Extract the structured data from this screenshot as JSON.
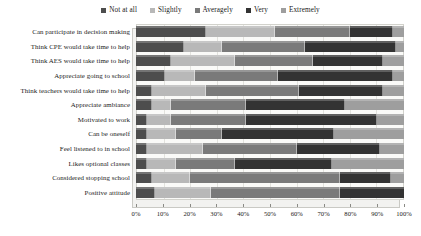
{
  "chart_data": {
    "type": "bar",
    "orientation": "horizontal",
    "stacked": true,
    "title": "",
    "xlabel": "",
    "ylabel": "",
    "xlim": [
      0,
      100
    ],
    "xunit": "%",
    "grid": true,
    "legend_position": "top-center",
    "xticks": [
      "0%",
      "10%",
      "20%",
      "30%",
      "40%",
      "50%",
      "60%",
      "70%",
      "80%",
      "90%",
      "100%"
    ],
    "categories": [
      "Can participate in decision making",
      "Think CPE would take time to help",
      "Think AES would take time to help",
      "Appreciate going to school",
      "Think teachers would take time to help",
      "Appreciate ambiance",
      "Motivated to work",
      "Can be oneself",
      "Feel listened to in school",
      "Likes optional classes",
      "Considered stopping school",
      "Positive attitude"
    ],
    "series": [
      {
        "name": "Not at all",
        "color": "#4d4d4d",
        "values": [
          26,
          18,
          13,
          11,
          6,
          6,
          4,
          4,
          4,
          4,
          6,
          7
        ]
      },
      {
        "name": "Slightly",
        "color": "#b8b8b8",
        "values": [
          26,
          14,
          24,
          11,
          20,
          7,
          9,
          11,
          21,
          11,
          14,
          21
        ]
      },
      {
        "name": "Averagely",
        "color": "#7a7a7a",
        "values": [
          28,
          31,
          29,
          31,
          35,
          28,
          28,
          17,
          35,
          22,
          56,
          48
        ]
      },
      {
        "name": "Very",
        "color": "#333333",
        "values": [
          16,
          34,
          26,
          43,
          31,
          37,
          49,
          42,
          31,
          36,
          19,
          24
        ]
      },
      {
        "name": "Extremely",
        "color": "#9e9e9e",
        "values": [
          4,
          3,
          8,
          4,
          8,
          22,
          10,
          26,
          9,
          27,
          5,
          0
        ]
      }
    ]
  }
}
